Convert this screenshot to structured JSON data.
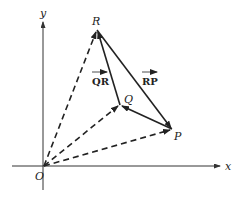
{
  "diagram": {
    "type": "vector-diagram",
    "axes": {
      "x_label": "x",
      "y_label": "y",
      "origin_label": "O"
    },
    "points": {
      "O": {
        "label": "O",
        "x": 44,
        "y": 166
      },
      "R": {
        "label": "R",
        "x": 97,
        "y": 30
      },
      "Q": {
        "label": "Q",
        "x": 120,
        "y": 105
      },
      "P": {
        "label": "P",
        "x": 172,
        "y": 129
      }
    },
    "vectors": [
      {
        "from": "O",
        "to": "R",
        "style": "dashed"
      },
      {
        "from": "O",
        "to": "Q",
        "style": "dashed"
      },
      {
        "from": "O",
        "to": "P",
        "style": "dashed"
      },
      {
        "from": "Q",
        "to": "R",
        "style": "solid",
        "label": "QR"
      },
      {
        "from": "R",
        "to": "P",
        "style": "solid",
        "label": "RP"
      },
      {
        "from": "P",
        "to": "Q",
        "style": "solid"
      }
    ],
    "vector_labels": {
      "qr": "QR",
      "rp": "RP"
    },
    "colors": {
      "stroke": "#222222",
      "axis": "#333333",
      "background": "#ffffff"
    }
  }
}
